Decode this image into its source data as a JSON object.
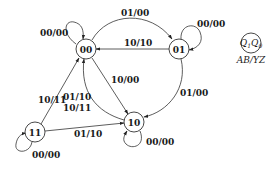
{
  "diagram": {
    "type": "state-diagram",
    "states": [
      {
        "id": "s00",
        "label": "00"
      },
      {
        "id": "s01",
        "label": "01"
      },
      {
        "id": "s10",
        "label": "10"
      },
      {
        "id": "s11",
        "label": "11"
      }
    ],
    "transitions": [
      {
        "from": "00",
        "to": "00",
        "label": "00/00"
      },
      {
        "from": "00",
        "to": "01",
        "label": "01/00"
      },
      {
        "from": "01",
        "to": "00",
        "label": "10/10"
      },
      {
        "from": "01",
        "to": "01",
        "label": "00/00"
      },
      {
        "from": "00",
        "to": "10",
        "label": "10/00"
      },
      {
        "from": "01",
        "to": "10",
        "label": "01/00"
      },
      {
        "from": "11",
        "to": "00",
        "label": "10/11"
      },
      {
        "from": "10",
        "to": "00",
        "label_line1": "01/10",
        "label_line2": "10/11"
      },
      {
        "from": "11",
        "to": "10",
        "label": "01/10"
      },
      {
        "from": "10",
        "to": "10",
        "label": "00/00"
      },
      {
        "from": "11",
        "to": "11",
        "label": "00/00"
      }
    ],
    "legend": {
      "state_label": "Q1Q0",
      "state_q1": "Q",
      "state_q1_sub": "1",
      "state_q0": "Q",
      "state_q0_sub": "0",
      "io_label": "AB/YZ"
    }
  }
}
